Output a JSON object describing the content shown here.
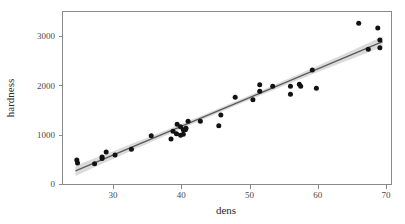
{
  "chart_data": {
    "type": "scatter",
    "title": "",
    "xlabel": "dens",
    "ylabel": "hardness",
    "xlim": [
      23.5,
      71.5
    ],
    "ylim": [
      0,
      3500
    ],
    "xticks": [
      30,
      40,
      50,
      60,
      70
    ],
    "xtick_labels": [
      "30",
      "40",
      "50",
      "60",
      "70"
    ],
    "yticks": [
      0,
      1000,
      2000,
      3000
    ],
    "ytick_labels": [
      "0",
      "1000",
      "2000",
      "3000"
    ],
    "grid": false,
    "legend": "none",
    "point_color": "#121212",
    "line_color": "#5a5a5a",
    "band_color": "#bdbdbd",
    "frame_color": "#8a8a8a",
    "regression": {
      "type": "linear-fit-with-confidence-band",
      "x_start": 24.5,
      "x_end": 69.5,
      "y_start": 265,
      "y_end": 2885,
      "slope": 58.2,
      "intercept": -1161,
      "band_halfwidth_center": 45,
      "band_halfwidth_ends": 105
    },
    "series": [
      {
        "name": "hardness vs dens",
        "points": [
          [
            24.7,
            484
          ],
          [
            24.8,
            427
          ],
          [
            27.3,
            413
          ],
          [
            28.4,
            517
          ],
          [
            28.4,
            549
          ],
          [
            29.0,
            648
          ],
          [
            30.3,
            587
          ],
          [
            32.7,
            704
          ],
          [
            35.6,
            979
          ],
          [
            38.5,
            914
          ],
          [
            38.8,
            1070
          ],
          [
            39.3,
            1020
          ],
          [
            39.4,
            1210
          ],
          [
            39.9,
            989
          ],
          [
            39.9,
            1160
          ],
          [
            40.3,
            1010
          ],
          [
            40.3,
            1100
          ],
          [
            40.6,
            1100
          ],
          [
            40.7,
            1130
          ],
          [
            41.0,
            1270
          ],
          [
            42.8,
            1270
          ],
          [
            45.5,
            1180
          ],
          [
            45.8,
            1400
          ],
          [
            47.9,
            1760
          ],
          [
            50.5,
            1710
          ],
          [
            51.5,
            2010
          ],
          [
            51.5,
            1880
          ],
          [
            53.4,
            1980
          ],
          [
            56.0,
            1820
          ],
          [
            56.0,
            1980
          ],
          [
            57.3,
            2020
          ],
          [
            57.5,
            1980
          ],
          [
            59.2,
            2310
          ],
          [
            59.8,
            1940
          ],
          [
            66.0,
            3260
          ],
          [
            67.4,
            2730
          ],
          [
            68.8,
            3160
          ],
          [
            69.1,
            2920
          ],
          [
            69.1,
            2760
          ]
        ]
      }
    ]
  }
}
